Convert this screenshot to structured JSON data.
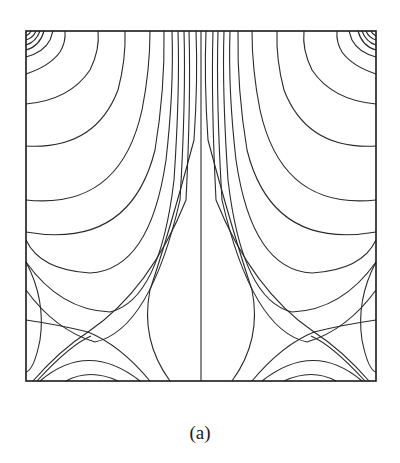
{
  "figure": {
    "caption": "(a)",
    "type": "contour plot (streamlines / iso-lines), left-right symmetric",
    "frame": {
      "x": 26,
      "y": 31,
      "width": 350,
      "height": 350
    },
    "symmetry_axis_x": 201,
    "colors": {
      "line": "#2a2a2a",
      "frame": "#1a1a1a",
      "background": "#ffffff"
    },
    "features": {
      "corner_vortices": [
        "top-left",
        "top-right"
      ],
      "saddle_points": [
        {
          "x": 88,
          "y": 332
        },
        {
          "x": 318,
          "y": 332
        }
      ],
      "center_line": "vertical line at symmetry axis"
    }
  }
}
